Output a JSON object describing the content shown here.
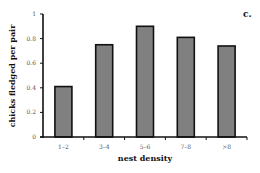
{
  "chart_data": {
    "type": "bar",
    "panel_label": "c.",
    "title": "",
    "xlabel": "nest density",
    "ylabel": "chicks fledged per pair",
    "categories": [
      "1–2",
      "3–4",
      "5–6",
      "7–8",
      ">8"
    ],
    "values": [
      0.41,
      0.75,
      0.9,
      0.81,
      0.74
    ],
    "ylim": [
      0,
      1
    ],
    "yticks": [
      0,
      0.2,
      0.4,
      0.6,
      0.8,
      1
    ],
    "ytick_labels": [
      "0",
      "0.2",
      "0.4",
      "0.6",
      "0.8",
      "1"
    ],
    "grid": false,
    "bar_color": "#808080",
    "bar_edge_color": "#111111"
  }
}
